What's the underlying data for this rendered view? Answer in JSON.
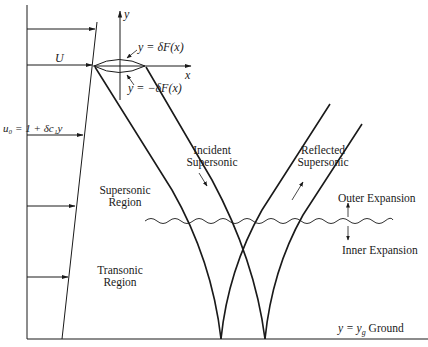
{
  "diagram": {
    "axes": {
      "x_label": "x",
      "y_label": "y"
    },
    "airfoil": {
      "upper_surface": "y = δF(x)",
      "lower_surface": "y = −δF(x)"
    },
    "freestream": {
      "label": "U",
      "profile_label": "u₀ = 1 + δc₁y"
    },
    "regions": {
      "supersonic": [
        "Supersonic",
        "Region"
      ],
      "transonic": [
        "Transonic",
        "Region"
      ]
    },
    "waves": {
      "incident": [
        "Incident",
        "Supersonic"
      ],
      "reflected": [
        "Reflected",
        "Supersonic"
      ]
    },
    "expansion": {
      "outer": "Outer Expansion",
      "inner": "Inner Expansion"
    },
    "ground": {
      "label_eq": "y = y",
      "label_sub": "g",
      "label_word": "Ground"
    },
    "colors": {
      "line": "#1a1a1a",
      "background": "#ffffff"
    }
  }
}
